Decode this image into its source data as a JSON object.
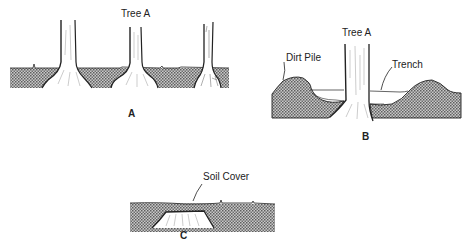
{
  "panels": {
    "a": {
      "caption": "A",
      "tree_label": "Tree A",
      "description": "Three trees at normal grade with root flares visible at soil surface"
    },
    "b": {
      "caption": "B",
      "tree_label": "Tree A",
      "dirt_pile_label": "Dirt Pile",
      "trench_label": "Trench",
      "description": "Trench dug beside tree with excavated dirt piled alongside"
    },
    "c": {
      "caption": "C",
      "soil_cover_label": "Soil Cover",
      "description": "Tree stump buried under soil cover"
    }
  },
  "colors": {
    "ink": "#222222",
    "soil_fill": "#8a8a8a",
    "background": "#ffffff"
  }
}
